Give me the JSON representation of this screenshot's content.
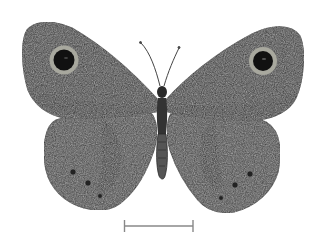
{
  "image": {
    "subject": "butterfly specimen, dorsal view",
    "style": "grayscale engraving",
    "background": "#ffffff",
    "colors": {
      "wing_dark": "#2a2a2a",
      "wing_mid": "#4a4a4a",
      "wing_light": "#6a6a6a",
      "eyespot_ring": "#a8a8a0",
      "eyespot_center": "#111111",
      "scale_bar": "#888888"
    },
    "features": {
      "forewing_eyespots": 2,
      "hindwing_ocelli_per_side": 3,
      "scale_bar": true
    }
  }
}
